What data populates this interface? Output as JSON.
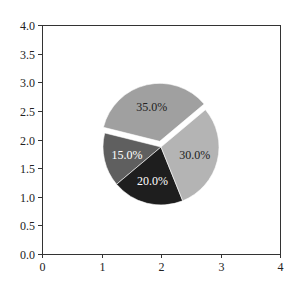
{
  "chart_data": {
    "type": "pie",
    "title": "",
    "xlabel": "",
    "ylabel": "",
    "labels": [
      "",
      "",
      "",
      ""
    ],
    "values": [
      35,
      15,
      20,
      30
    ],
    "autopct": [
      "35.0%",
      "15.0%",
      "20.0%",
      "30.0%"
    ],
    "colors": [
      "#a0a0a0",
      "#5f5f5f",
      "#1e1e1e",
      "#b4b4b4"
    ],
    "label_colors": [
      "#222222",
      "#ffffff",
      "#ffffff",
      "#222222"
    ],
    "explode": [
      0.1,
      0,
      0,
      0
    ],
    "startangle": 40,
    "counterclock": true,
    "center": [
      2.0,
      1.87
    ],
    "radius": 1.0,
    "xlim": [
      0,
      4
    ],
    "ylim": [
      0.0,
      4.0
    ],
    "xticks": [
      0,
      1,
      2,
      3,
      4
    ],
    "xtick_labels": [
      "0",
      "1",
      "2",
      "3",
      "4"
    ],
    "yticks": [
      0.0,
      0.5,
      1.0,
      1.5,
      2.0,
      2.5,
      3.0,
      3.5,
      4.0
    ],
    "ytick_labels": [
      "0.0",
      "0.5",
      "1.0",
      "1.5",
      "2.0",
      "2.5",
      "3.0",
      "3.5",
      "4.0"
    ],
    "grid": false,
    "legend": null
  },
  "layout": {
    "plot_left": 42,
    "plot_right": 280,
    "plot_top": 25,
    "plot_bottom": 254,
    "pie_center_px": [
      161,
      147
    ],
    "pie_radius_px": 58
  }
}
